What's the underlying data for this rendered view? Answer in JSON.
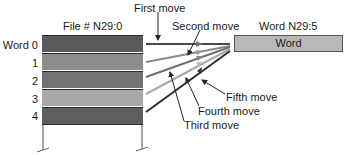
{
  "diagram": {
    "file_title": "File # N29:0",
    "dest_title": "Word N29:5",
    "dest_word_label": "Word",
    "rows": [
      {
        "label": "Word 0",
        "color": "#5a5a5a"
      },
      {
        "label": "1",
        "color": "#8c8c8c"
      },
      {
        "label": "2",
        "color": "#737373"
      },
      {
        "label": "3",
        "color": "#a8a8a8"
      },
      {
        "label": "4",
        "color": "#5e5e5e"
      }
    ],
    "moves": [
      {
        "label": "First move",
        "color": "#4a4a4a"
      },
      {
        "label": "Second move",
        "color": "#8a8a8a"
      },
      {
        "label": "Third move",
        "color": "#707070"
      },
      {
        "label": "Fourth move",
        "color": "#a8a8a8"
      },
      {
        "label": "Fifth move",
        "color": "#2e2e2e"
      }
    ],
    "colors": {
      "dest_box_fill": "#b8b8b8",
      "outline": "#2a2a2a"
    }
  }
}
